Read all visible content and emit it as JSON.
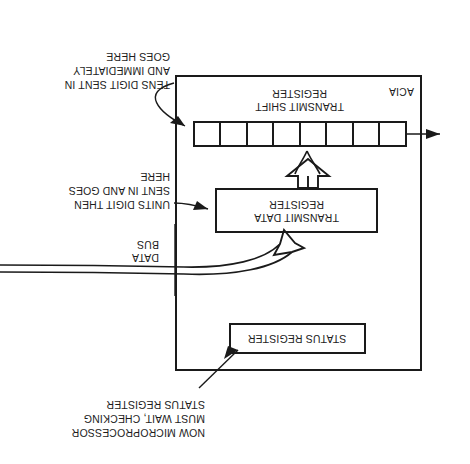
{
  "figure": {
    "orientation": "rotated-180",
    "enclosure_label": "ACIA",
    "ink_color": "#1a1a1a",
    "paper_color": "#ffffff"
  },
  "blocks": {
    "status_register": "STATUS REGISTER",
    "transmit_data_register": "TRANSMIT DATA\nREGISTER",
    "transmit_shift_register": "TRANSMIT SHIFT\nREGISTER",
    "shift_register_cell_count": 8
  },
  "labels": {
    "data_bus": "DATA\nBUS"
  },
  "annotations": {
    "status_note": "NOW MICROPROCESSOR\nMUST WAIT, CHECKING\nSTATUS REGISTER",
    "units_note": "UNITS DIGIT THEN\nSENT IN AND GOES\nHERE",
    "tens_note": "TENS DIGIT SENT IN\nAND IMMEDIATELY\nGOES HERE"
  }
}
